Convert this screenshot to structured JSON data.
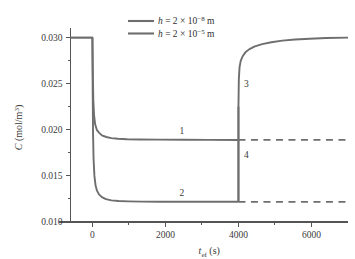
{
  "chart_data": {
    "type": "line",
    "title": "",
    "xlabel": "t_ef (s)",
    "xlabel_base": "t",
    "xlabel_sub": "ef",
    "xlabel_unit": " (s)",
    "ylabel": "C (mol/m3)",
    "ylabel_base": "C (mol/m",
    "ylabel_sup": "3",
    "ylabel_close": ")",
    "xlim": [
      -600,
      7000
    ],
    "ylim": [
      0.01,
      0.0305
    ],
    "xticks": [
      0,
      2000,
      4000,
      6000
    ],
    "xtick_labels": [
      "0",
      "2000",
      "4000",
      "6000"
    ],
    "xminor_ticks": [
      1000,
      3000,
      5000
    ],
    "yticks": [
      0.01,
      0.015,
      0.02,
      0.025,
      0.03
    ],
    "ytick_labels": [
      "0.010",
      "0.015",
      "0.020",
      "0.025",
      "0.030"
    ],
    "yminor_ticks": [
      0.0125,
      0.0175,
      0.0225,
      0.0275
    ],
    "grid": false,
    "legend_position": "top-center",
    "line_color": "#6e6e6e",
    "axis_color": "#555555",
    "text_color": "#3a3a3a",
    "series": [
      {
        "name": "curve-1",
        "legend_label": "h = 2 x 10^-8 m",
        "legend_base": "h",
        "legend_eq": " = 2 × 10",
        "legend_exp": "−8",
        "legend_unit": " m",
        "curve_number": "1",
        "style": "solid",
        "initial_value": 0.03,
        "plateau_value": 0.019,
        "step_time": 4000,
        "points": [
          [
            -600,
            0.03
          ],
          [
            -20,
            0.03
          ],
          [
            0,
            0.03
          ],
          [
            10,
            0.0265
          ],
          [
            25,
            0.0232
          ],
          [
            45,
            0.0216
          ],
          [
            75,
            0.0206
          ],
          [
            120,
            0.02
          ],
          [
            180,
            0.0197
          ],
          [
            260,
            0.0194
          ],
          [
            380,
            0.01922
          ],
          [
            520,
            0.0191
          ],
          [
            700,
            0.01903
          ],
          [
            950,
            0.01898
          ],
          [
            1300,
            0.01895
          ],
          [
            1800,
            0.01893
          ],
          [
            2500,
            0.01892
          ],
          [
            3200,
            0.01891
          ],
          [
            4000,
            0.0189
          ]
        ]
      },
      {
        "name": "curve-2",
        "legend_label": "h = 2 x 10^-5 m",
        "legend_base": "h",
        "legend_eq": " = 2 × 10",
        "legend_exp": "−5",
        "legend_unit": " m",
        "curve_number": "2",
        "style": "solid",
        "initial_value": 0.03,
        "plateau_value": 0.0122,
        "step_time": 4000,
        "points": [
          [
            -600,
            0.03
          ],
          [
            -20,
            0.03
          ],
          [
            0,
            0.03
          ],
          [
            8,
            0.024
          ],
          [
            18,
            0.0195
          ],
          [
            32,
            0.0168
          ],
          [
            55,
            0.015
          ],
          [
            85,
            0.014
          ],
          [
            125,
            0.0134
          ],
          [
            180,
            0.013
          ],
          [
            260,
            0.0127
          ],
          [
            370,
            0.01248
          ],
          [
            520,
            0.01235
          ],
          [
            720,
            0.01228
          ],
          [
            980,
            0.01224
          ],
          [
            1350,
            0.01221
          ],
          [
            1900,
            0.0122
          ],
          [
            2700,
            0.01219
          ],
          [
            3500,
            0.01219
          ],
          [
            4000,
            0.01219
          ]
        ]
      },
      {
        "name": "curve-3",
        "curve_number": "3",
        "style": "solid",
        "description": "recovery branch after step at t=4000",
        "points": [
          [
            4000,
            0.01219
          ],
          [
            4000,
            0.0225
          ],
          [
            4010,
            0.0255
          ],
          [
            4030,
            0.0268
          ],
          [
            4060,
            0.02745
          ],
          [
            4110,
            0.02795
          ],
          [
            4190,
            0.0284
          ],
          [
            4300,
            0.02875
          ],
          [
            4450,
            0.02905
          ],
          [
            4650,
            0.0293
          ],
          [
            4900,
            0.0295
          ],
          [
            5200,
            0.02967
          ],
          [
            5550,
            0.02979
          ],
          [
            5950,
            0.02988
          ],
          [
            6400,
            0.02995
          ],
          [
            7000,
            0.03
          ]
        ]
      },
      {
        "name": "curve-4",
        "curve_number": "4",
        "style": "vertical-segment",
        "description": "vertical step segment at t=4000",
        "points": [
          [
            4000,
            0.01219
          ],
          [
            4000,
            0.0225
          ]
        ]
      }
    ],
    "dashed_lines": [
      {
        "name": "dashed-level-1",
        "y": 0.0189,
        "x_start": 4000,
        "x_end": 7000
      },
      {
        "name": "dashed-level-2",
        "y": 0.01219,
        "x_start": 4000,
        "x_end": 7000
      }
    ],
    "curve_labels": [
      {
        "text": "1",
        "x": 2450,
        "y": 0.01955
      },
      {
        "text": "2",
        "x": 2450,
        "y": 0.01285
      },
      {
        "text": "3",
        "x": 4220,
        "y": 0.0246
      },
      {
        "text": "4",
        "x": 4220,
        "y": 0.0169
      }
    ]
  }
}
